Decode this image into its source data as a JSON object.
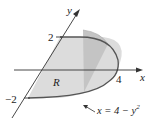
{
  "labels": {
    "y_axis": "y",
    "x_axis": "x",
    "tick_y_pos": "2",
    "tick_y_neg": "−2",
    "tick_x": "4",
    "region": "R",
    "curve_eq_lhs": "x = 4 − y",
    "curve_eq_exp": "2"
  },
  "colors": {
    "region_fill": "#dcdcdc",
    "slice_fill": "#bdbdbd",
    "curve": "#555555",
    "axis": "#333333"
  }
}
